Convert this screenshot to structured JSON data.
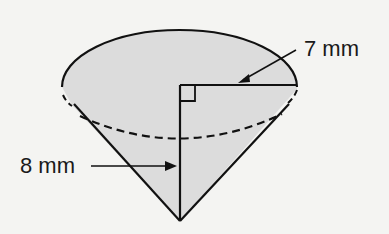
{
  "figure": {
    "type": "cone",
    "labels": {
      "radius": "7 mm",
      "height": "8 mm"
    },
    "colors": {
      "fill": "#dcdcdc",
      "stroke": "#111111",
      "background": "#f4f4f2"
    }
  }
}
